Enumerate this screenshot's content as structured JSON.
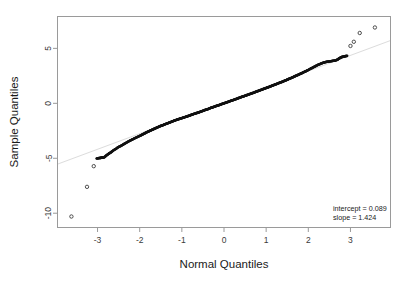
{
  "figure": {
    "background_color": "#ffffff",
    "frame_color": "#9a9a9a",
    "point_color": "#111111",
    "reference_line_color": "#dcdcdc"
  },
  "chart_data": {
    "type": "scatter",
    "title": "",
    "xlabel": "Normal Quantiles",
    "ylabel": "Sample Quantiles",
    "xlim": [
      -3.95,
      3.95
    ],
    "ylim": [
      -11.3,
      7.9
    ],
    "xticks": [
      -3,
      -2,
      -1,
      0,
      1,
      2,
      3
    ],
    "xtick_labels": [
      "-3",
      "-2",
      "-1",
      "0",
      "1",
      "2",
      "3"
    ],
    "yticks": [
      5,
      0,
      -5,
      -10
    ],
    "ytick_labels": [
      "5",
      "0",
      "-5",
      "-10"
    ],
    "grid": false,
    "legend": null,
    "annotations": [
      {
        "text": "intercept = 0.089",
        "x": 2.05,
        "y": -8.45
      },
      {
        "text": "slope = 1.424",
        "x": 2.05,
        "y": -9.35
      }
    ],
    "reference_line": {
      "intercept": 0.089,
      "slope": 1.424,
      "color": "#dcdcdc",
      "style": "solid"
    },
    "series": [
      {
        "name": "Sample quantiles",
        "marker": "point",
        "x": [
          -3.62,
          -3.25,
          -3.09,
          -3.02,
          -2.97,
          -2.93,
          -2.9,
          -2.87,
          -2.84,
          -2.8,
          -2.76,
          -2.72,
          -2.68,
          -2.63,
          -2.58,
          -2.53,
          -2.48,
          -2.43,
          -2.38,
          -2.33,
          -2.28,
          -2.23,
          -2.18,
          -2.13,
          -2.08,
          -2.03,
          -1.98,
          -1.94,
          -1.9,
          -1.86,
          -1.82,
          -1.78,
          -1.74,
          -1.7,
          -1.66,
          -1.62,
          -1.58,
          -1.54,
          -1.5,
          -1.46,
          -1.42,
          -1.38,
          -1.34,
          -1.3,
          -1.26,
          -1.22,
          -1.18,
          -1.14,
          -1.1,
          -1.06,
          -1.02,
          -0.98,
          -0.94,
          -0.9,
          -0.86,
          -0.82,
          -0.78,
          -0.74,
          -0.7,
          -0.66,
          -0.62,
          -0.58,
          -0.54,
          -0.5,
          -0.46,
          -0.42,
          -0.38,
          -0.34,
          -0.3,
          -0.26,
          -0.22,
          -0.18,
          -0.14,
          -0.1,
          -0.06,
          -0.02,
          0.02,
          0.06,
          0.1,
          0.14,
          0.18,
          0.22,
          0.26,
          0.3,
          0.34,
          0.38,
          0.42,
          0.46,
          0.5,
          0.54,
          0.58,
          0.62,
          0.66,
          0.7,
          0.74,
          0.78,
          0.82,
          0.86,
          0.9,
          0.94,
          0.98,
          1.02,
          1.06,
          1.1,
          1.14,
          1.18,
          1.22,
          1.26,
          1.3,
          1.34,
          1.38,
          1.42,
          1.46,
          1.5,
          1.54,
          1.58,
          1.62,
          1.66,
          1.7,
          1.74,
          1.78,
          1.82,
          1.86,
          1.9,
          1.94,
          1.98,
          2.03,
          2.08,
          2.13,
          2.18,
          2.23,
          2.28,
          2.33,
          2.38,
          2.43,
          2.48,
          2.53,
          2.58,
          2.63,
          2.68,
          2.72,
          2.76,
          2.8,
          2.84,
          2.88,
          2.92,
          3.0,
          3.08,
          3.22,
          3.58
        ],
        "y": [
          -10.3,
          -7.6,
          -5.72,
          -5.02,
          -4.99,
          -4.97,
          -4.95,
          -4.93,
          -4.9,
          -4.78,
          -4.66,
          -4.55,
          -4.45,
          -4.3,
          -4.18,
          -4.05,
          -3.94,
          -3.83,
          -3.72,
          -3.61,
          -3.5,
          -3.4,
          -3.3,
          -3.2,
          -3.11,
          -3.02,
          -2.93,
          -2.85,
          -2.77,
          -2.69,
          -2.61,
          -2.54,
          -2.47,
          -2.4,
          -2.33,
          -2.26,
          -2.19,
          -2.12,
          -2.06,
          -2.0,
          -1.94,
          -1.88,
          -1.82,
          -1.76,
          -1.7,
          -1.64,
          -1.58,
          -1.52,
          -1.47,
          -1.42,
          -1.37,
          -1.32,
          -1.27,
          -1.22,
          -1.17,
          -1.12,
          -1.06,
          -1.0,
          -0.95,
          -0.9,
          -0.85,
          -0.8,
          -0.74,
          -0.68,
          -0.62,
          -0.57,
          -0.52,
          -0.46,
          -0.4,
          -0.35,
          -0.3,
          -0.24,
          -0.19,
          -0.14,
          -0.08,
          -0.03,
          0.03,
          0.08,
          0.14,
          0.19,
          0.25,
          0.3,
          0.36,
          0.41,
          0.47,
          0.52,
          0.58,
          0.63,
          0.69,
          0.74,
          0.8,
          0.85,
          0.91,
          0.96,
          1.02,
          1.08,
          1.14,
          1.19,
          1.25,
          1.31,
          1.37,
          1.42,
          1.48,
          1.54,
          1.6,
          1.66,
          1.72,
          1.78,
          1.84,
          1.9,
          1.96,
          2.02,
          2.08,
          2.15,
          2.22,
          2.28,
          2.35,
          2.42,
          2.49,
          2.56,
          2.63,
          2.7,
          2.77,
          2.85,
          2.92,
          3.0,
          3.1,
          3.2,
          3.3,
          3.4,
          3.5,
          3.58,
          3.66,
          3.72,
          3.77,
          3.8,
          3.83,
          3.86,
          3.88,
          3.95,
          4.05,
          4.15,
          4.22,
          4.25,
          4.3,
          4.32,
          5.22,
          5.6,
          6.4,
          6.9
        ]
      }
    ],
    "outlier_indices": [
      0,
      1,
      2,
      146,
      147,
      148,
      149
    ]
  }
}
